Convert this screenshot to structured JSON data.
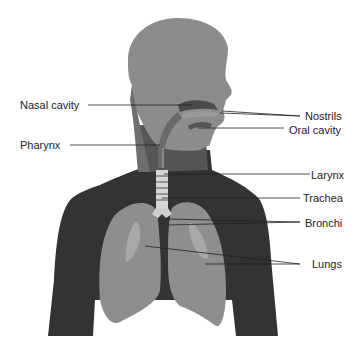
{
  "diagram": {
    "colors": {
      "background": "#ffffff",
      "head": "#8c8c8c",
      "head_dark": "#6e6e6e",
      "torso": "#333333",
      "lung": "#8e8e8e",
      "lung_light": "#a8a8a8",
      "trachea": "#d6d6d6",
      "trachea_ring": "#555555",
      "airway": "#5a5a5a",
      "leader_line": "#222222",
      "text": "#222222"
    },
    "labels": {
      "left": [
        {
          "id": "nasal-cavity",
          "text": "Nasal cavity"
        },
        {
          "id": "pharynx",
          "text": "Pharynx"
        }
      ],
      "right": [
        {
          "id": "nostrils",
          "text": "Nostrils"
        },
        {
          "id": "oral-cavity",
          "text": "Oral cavity"
        },
        {
          "id": "larynx",
          "text": "Larynx"
        },
        {
          "id": "trachea",
          "text": "Trachea"
        },
        {
          "id": "bronchi",
          "text": "Bronchi"
        },
        {
          "id": "lungs",
          "text": "Lungs"
        }
      ]
    }
  }
}
